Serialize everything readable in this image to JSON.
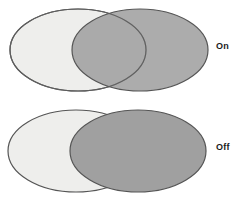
{
  "figure": {
    "background": "#ffffff"
  },
  "colors": {
    "background": "#ffffff",
    "light_ellipse_fill": "#eeeeec",
    "dark_ellipse_fill": "#a0a0a0",
    "overlap_fill": "#9d9d9d",
    "outline": "#555555",
    "label_text": "#1b1b1b"
  },
  "rows": [
    {
      "id": "transparency-on",
      "label": "On",
      "light_ellipse": {
        "name": "light-ellipse",
        "cx": 78,
        "cy": 50,
        "rx": 68,
        "ry": 42,
        "fill": "#eeeeec",
        "opacity": 1
      },
      "dark_ellipse": {
        "name": "dark-ellipse",
        "cx": 140,
        "cy": 50,
        "rx": 68,
        "ry": 42,
        "fill": "#a0a0a0",
        "opacity": 0.85,
        "transparent": true
      },
      "overlap_visible": true,
      "outlines_visible_through_overlap": true
    },
    {
      "id": "transparency-off",
      "label": "Off",
      "light_ellipse": {
        "name": "light-ellipse",
        "cx": 76,
        "cy": 50,
        "rx": 68,
        "ry": 42,
        "fill": "#eeeeec",
        "opacity": 1
      },
      "dark_ellipse": {
        "name": "dark-ellipse",
        "cx": 138,
        "cy": 50,
        "rx": 68,
        "ry": 42,
        "fill": "#a0a0a0",
        "opacity": 1,
        "transparent": false
      },
      "overlap_visible": false,
      "outlines_visible_through_overlap": false
    }
  ]
}
